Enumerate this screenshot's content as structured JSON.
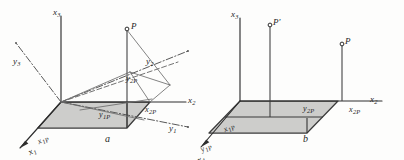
{
  "figure": {
    "type": "technical-line-diagram",
    "background_color": "#fdfdfc",
    "ink_color": "#2e2e2e",
    "plane_fill_color": "#c9c9c7",
    "captions": [
      {
        "id": "caption-a",
        "text": "a"
      },
      {
        "id": "caption-b",
        "text": "b"
      }
    ]
  },
  "panel_a": {
    "caption": "a",
    "axis_labels": {
      "x3": "x",
      "x3_sub": "3",
      "x2": "x",
      "x2_sub": "2",
      "x1": "x",
      "x1_sub": "1",
      "y3": "y",
      "y3_sub": "3",
      "y2": "y",
      "y2_sub": "2",
      "y1": "y",
      "y1_sub": "1"
    },
    "projection_labels": {
      "x1p": "x",
      "x1p_sub": "1P",
      "x2p": "x",
      "x2p_sub": "2P",
      "y1p": "y",
      "y1p_sub": "1P",
      "y2p": "y",
      "y2p_sub": "2P"
    },
    "points": [
      {
        "name": "P",
        "label": "P",
        "marker": "open-circle"
      }
    ]
  },
  "panel_b": {
    "caption": "b",
    "axis_labels": {
      "x3": "x",
      "x3_sub": "3",
      "x2": "x",
      "x2_sub": "2",
      "x1": "x",
      "x1_sub": "1"
    },
    "projection_labels": {
      "x1p": "x",
      "x1p_sub": "1P",
      "x2p": "x",
      "x2p_sub": "2P",
      "y1p": "y",
      "y1p_sub": "1P",
      "y2p": "y",
      "y2p_sub": "2P"
    },
    "points": [
      {
        "name": "P-prime",
        "label": "P'",
        "marker": "open-circle"
      },
      {
        "name": "P",
        "label": "P",
        "marker": "open-circle"
      }
    ]
  }
}
